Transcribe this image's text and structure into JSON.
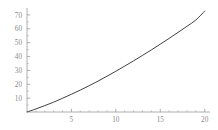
{
  "figure": {
    "background_color": "#ffffff",
    "curve_color": "#2b2b2b",
    "axis_color": "#9a9a9a",
    "tick_label_color": "#8a8a8a"
  },
  "chart_data": {
    "type": "line",
    "title": "",
    "subtitle": "",
    "xlabel": "",
    "ylabel": "",
    "xlim": [
      0,
      20.6
    ],
    "ylim": [
      0,
      75
    ],
    "grid": false,
    "legend": null,
    "annotations": [],
    "xticks": [
      5,
      10,
      15,
      20
    ],
    "xtick_labels": [
      "5",
      "10",
      "15",
      "20"
    ],
    "xticks_minor": [
      1,
      2,
      3,
      4,
      6,
      7,
      8,
      9,
      11,
      12,
      13,
      14,
      16,
      17,
      18,
      19
    ],
    "yticks": [
      10,
      20,
      30,
      40,
      50,
      60,
      70
    ],
    "ytick_labels": [
      "10",
      "20",
      "30",
      "40",
      "50",
      "60",
      "70"
    ],
    "yticks_minor": [
      5,
      15,
      25,
      35,
      45,
      55,
      65
    ],
    "series": [
      {
        "name": "curve",
        "color": "#2b2b2b",
        "x": [
          0,
          1,
          2,
          3,
          4,
          5,
          6,
          7,
          8,
          9,
          10,
          11,
          12,
          13,
          14,
          15,
          16,
          17,
          18,
          19,
          20
        ],
        "y": [
          0,
          2.2,
          4.6,
          7.1,
          9.9,
          12.8,
          15.8,
          19.0,
          22.3,
          25.8,
          29.4,
          33.1,
          36.9,
          40.8,
          44.8,
          48.9,
          53.1,
          57.4,
          61.8,
          66.3,
          72.8
        ]
      }
    ]
  }
}
